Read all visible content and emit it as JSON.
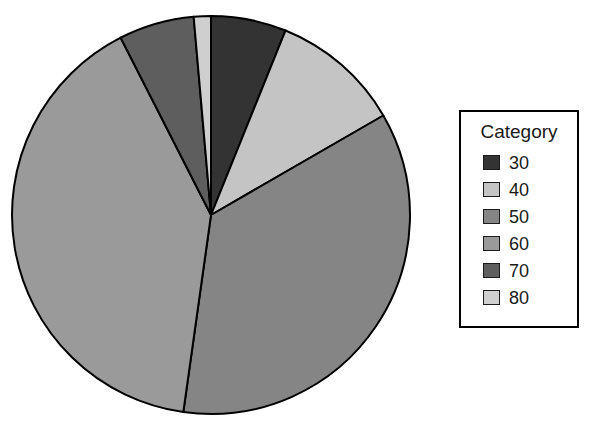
{
  "chart_data": {
    "type": "pie",
    "title": "",
    "legend_title": "Category",
    "legend_position": "right",
    "grid": false,
    "start_angle_deg": 0,
    "direction": "clockwise",
    "categories": [
      "30",
      "40",
      "50",
      "60",
      "70",
      "80"
    ],
    "values": [
      6.1,
      10.6,
      35.6,
      40.3,
      6.1,
      1.3
    ],
    "angles_deg": [
      22,
      38,
      128,
      145,
      22,
      5
    ],
    "colors": [
      "#333333",
      "#c4c4c4",
      "#858585",
      "#9a9a9a",
      "#5e5e5e",
      "#cfcfcf"
    ],
    "slice_border_color": "#000000",
    "background": "#ffffff",
    "xlabel": "",
    "ylabel": ""
  },
  "legend": {
    "title": "Category",
    "items": [
      {
        "label": "30",
        "color": "#333333"
      },
      {
        "label": "40",
        "color": "#c4c4c4"
      },
      {
        "label": "50",
        "color": "#858585"
      },
      {
        "label": "60",
        "color": "#9a9a9a"
      },
      {
        "label": "70",
        "color": "#5e5e5e"
      },
      {
        "label": "80",
        "color": "#cfcfcf"
      }
    ]
  },
  "pie_geometry": {
    "cx": 211,
    "cy": 215,
    "r": 199
  }
}
